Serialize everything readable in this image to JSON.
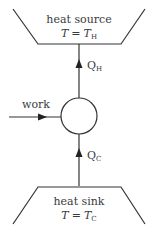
{
  "diagram": {
    "type": "heat pump / refrigerator schematic",
    "colors": {
      "stroke": "#333333",
      "text": "#3a3a3a",
      "background": "#ffffff"
    },
    "heat_source": {
      "label": "heat source",
      "temp_var": "T",
      "equals": "=",
      "temp_symbol": "T",
      "temp_subscript": "H"
    },
    "heat_sink": {
      "label": "heat sink",
      "temp_var": "T",
      "equals": "=",
      "temp_symbol": "T",
      "temp_subscript": "C"
    },
    "engine": {
      "shape": "circle"
    },
    "work_input": {
      "label": "work",
      "direction": "into engine (left to right)"
    },
    "heat_flow_hot": {
      "symbol": "Q",
      "subscript": "H",
      "direction": "engine to source (upward)"
    },
    "heat_flow_cold": {
      "symbol": "Q",
      "subscript": "C",
      "direction": "sink to engine (upward)"
    }
  }
}
